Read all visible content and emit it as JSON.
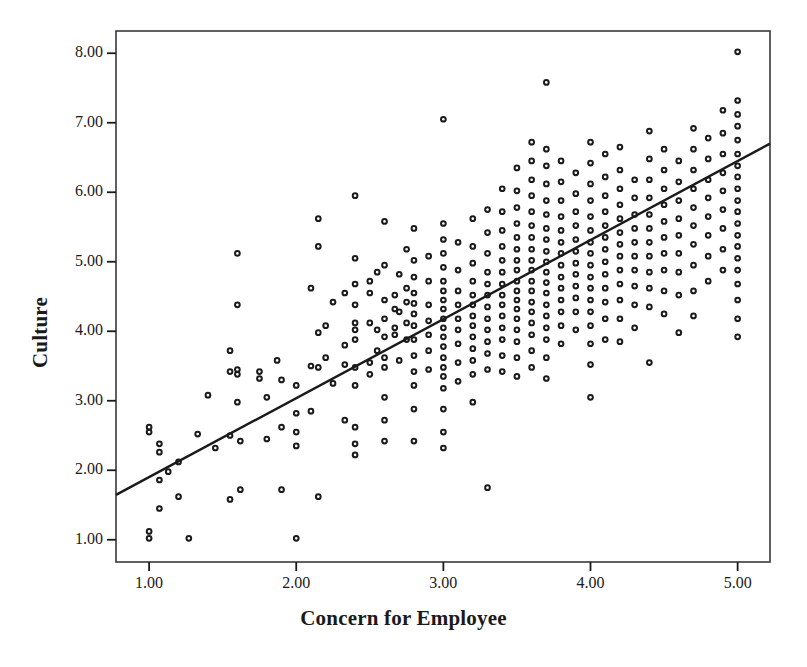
{
  "chart_data": {
    "type": "scatter",
    "title": "",
    "xlabel": "Concern for Employee",
    "ylabel": "Culture",
    "xlim": [
      0.775,
      5.22
    ],
    "ylim": [
      0.68,
      8.32
    ],
    "xticks": [
      "1.00",
      "2.00",
      "3.00",
      "4.00",
      "5.00"
    ],
    "xtick_values": [
      1,
      2,
      3,
      4,
      5
    ],
    "yticks": [
      "1.00",
      "2.00",
      "3.00",
      "4.00",
      "5.00",
      "6.00",
      "7.00",
      "8.00"
    ],
    "ytick_values": [
      1,
      2,
      3,
      4,
      5,
      6,
      7,
      8
    ],
    "grid": false,
    "legend": null,
    "marker": "open-circle",
    "marker_color": "#1a1a1a",
    "frame_color": "#3a3a3a",
    "background": "#ffffff",
    "fit_line": {
      "type": "linear-regression",
      "color": "#1a1a1a",
      "x_start": 0.775,
      "y_start": 1.645,
      "x_end": 5.22,
      "y_end": 6.7,
      "slope": 1.138,
      "intercept": 0.763
    },
    "points": [
      [
        1.0,
        2.62
      ],
      [
        1.0,
        2.55
      ],
      [
        1.0,
        1.12
      ],
      [
        1.0,
        1.02
      ],
      [
        1.07,
        2.38
      ],
      [
        1.07,
        2.26
      ],
      [
        1.07,
        1.86
      ],
      [
        1.07,
        1.45
      ],
      [
        1.13,
        1.98
      ],
      [
        1.2,
        2.12
      ],
      [
        1.2,
        1.62
      ],
      [
        1.27,
        1.02
      ],
      [
        1.33,
        2.52
      ],
      [
        1.4,
        3.08
      ],
      [
        1.45,
        2.32
      ],
      [
        1.55,
        3.72
      ],
      [
        1.55,
        3.42
      ],
      [
        1.55,
        2.5
      ],
      [
        1.55,
        1.58
      ],
      [
        1.6,
        5.12
      ],
      [
        1.6,
        4.38
      ],
      [
        1.6,
        3.45
      ],
      [
        1.6,
        3.38
      ],
      [
        1.6,
        2.98
      ],
      [
        1.62,
        2.42
      ],
      [
        1.62,
        1.72
      ],
      [
        1.75,
        3.42
      ],
      [
        1.75,
        3.32
      ],
      [
        1.8,
        3.05
      ],
      [
        1.8,
        2.45
      ],
      [
        1.87,
        3.58
      ],
      [
        1.9,
        3.3
      ],
      [
        1.9,
        2.62
      ],
      [
        1.9,
        1.72
      ],
      [
        2.0,
        3.22
      ],
      [
        2.0,
        2.82
      ],
      [
        2.0,
        2.55
      ],
      [
        2.0,
        2.35
      ],
      [
        2.0,
        1.02
      ],
      [
        2.1,
        4.62
      ],
      [
        2.1,
        3.5
      ],
      [
        2.1,
        2.85
      ],
      [
        2.15,
        5.62
      ],
      [
        2.15,
        5.22
      ],
      [
        2.15,
        3.98
      ],
      [
        2.15,
        3.48
      ],
      [
        2.15,
        1.62
      ],
      [
        2.2,
        4.08
      ],
      [
        2.2,
        3.62
      ],
      [
        2.25,
        4.42
      ],
      [
        2.25,
        3.25
      ],
      [
        2.33,
        4.55
      ],
      [
        2.33,
        3.8
      ],
      [
        2.33,
        3.52
      ],
      [
        2.33,
        2.72
      ],
      [
        2.4,
        5.95
      ],
      [
        2.4,
        5.05
      ],
      [
        2.4,
        4.68
      ],
      [
        2.4,
        4.38
      ],
      [
        2.4,
        4.12
      ],
      [
        2.4,
        4.02
      ],
      [
        2.4,
        3.88
      ],
      [
        2.4,
        3.48
      ],
      [
        2.4,
        3.22
      ],
      [
        2.4,
        2.62
      ],
      [
        2.4,
        2.38
      ],
      [
        2.4,
        2.22
      ],
      [
        2.5,
        4.72
      ],
      [
        2.5,
        4.55
      ],
      [
        2.5,
        4.12
      ],
      [
        2.5,
        3.55
      ],
      [
        2.5,
        3.38
      ],
      [
        2.55,
        4.85
      ],
      [
        2.55,
        4.02
      ],
      [
        2.55,
        3.72
      ],
      [
        2.6,
        5.58
      ],
      [
        2.6,
        4.95
      ],
      [
        2.6,
        4.45
      ],
      [
        2.6,
        4.18
      ],
      [
        2.6,
        3.92
      ],
      [
        2.6,
        3.62
      ],
      [
        2.6,
        3.48
      ],
      [
        2.6,
        3.05
      ],
      [
        2.6,
        2.72
      ],
      [
        2.6,
        2.42
      ],
      [
        2.67,
        4.52
      ],
      [
        2.67,
        4.32
      ],
      [
        2.67,
        4.05
      ],
      [
        2.67,
        3.95
      ],
      [
        2.7,
        4.82
      ],
      [
        2.7,
        4.28
      ],
      [
        2.7,
        3.58
      ],
      [
        2.75,
        5.18
      ],
      [
        2.75,
        4.62
      ],
      [
        2.75,
        4.42
      ],
      [
        2.75,
        4.12
      ],
      [
        2.75,
        3.88
      ],
      [
        2.8,
        5.48
      ],
      [
        2.8,
        5.02
      ],
      [
        2.8,
        4.78
      ],
      [
        2.8,
        4.55
      ],
      [
        2.8,
        4.4
      ],
      [
        2.8,
        4.25
      ],
      [
        2.8,
        4.08
      ],
      [
        2.8,
        3.88
      ],
      [
        2.8,
        3.65
      ],
      [
        2.8,
        3.42
      ],
      [
        2.8,
        3.22
      ],
      [
        2.8,
        2.88
      ],
      [
        2.8,
        2.42
      ],
      [
        2.9,
        5.08
      ],
      [
        2.9,
        4.72
      ],
      [
        2.9,
        4.38
      ],
      [
        2.9,
        4.15
      ],
      [
        2.9,
        3.95
      ],
      [
        2.9,
        3.72
      ],
      [
        2.9,
        3.45
      ],
      [
        3.0,
        7.05
      ],
      [
        3.0,
        5.55
      ],
      [
        3.0,
        5.32
      ],
      [
        3.0,
        5.12
      ],
      [
        3.0,
        4.92
      ],
      [
        3.0,
        4.72
      ],
      [
        3.0,
        4.58
      ],
      [
        3.0,
        4.45
      ],
      [
        3.0,
        4.32
      ],
      [
        3.0,
        4.18
      ],
      [
        3.0,
        4.05
      ],
      [
        3.0,
        3.92
      ],
      [
        3.0,
        3.78
      ],
      [
        3.0,
        3.62
      ],
      [
        3.0,
        3.48
      ],
      [
        3.0,
        3.35
      ],
      [
        3.0,
        3.18
      ],
      [
        3.0,
        2.88
      ],
      [
        3.0,
        2.55
      ],
      [
        3.0,
        2.32
      ],
      [
        3.1,
        5.28
      ],
      [
        3.1,
        4.88
      ],
      [
        3.1,
        4.58
      ],
      [
        3.1,
        4.38
      ],
      [
        3.1,
        4.18
      ],
      [
        3.1,
        4.02
      ],
      [
        3.1,
        3.82
      ],
      [
        3.1,
        3.55
      ],
      [
        3.1,
        3.28
      ],
      [
        3.2,
        5.62
      ],
      [
        3.2,
        5.22
      ],
      [
        3.2,
        4.98
      ],
      [
        3.2,
        4.72
      ],
      [
        3.2,
        4.52
      ],
      [
        3.2,
        4.38
      ],
      [
        3.2,
        4.22
      ],
      [
        3.2,
        4.08
      ],
      [
        3.2,
        3.92
      ],
      [
        3.2,
        3.75
      ],
      [
        3.2,
        3.58
      ],
      [
        3.2,
        3.38
      ],
      [
        3.2,
        2.98
      ],
      [
        3.3,
        5.75
      ],
      [
        3.3,
        5.42
      ],
      [
        3.3,
        5.12
      ],
      [
        3.3,
        4.85
      ],
      [
        3.3,
        4.68
      ],
      [
        3.3,
        4.52
      ],
      [
        3.3,
        4.35
      ],
      [
        3.3,
        4.18
      ],
      [
        3.3,
        4.02
      ],
      [
        3.3,
        3.85
      ],
      [
        3.3,
        3.68
      ],
      [
        3.3,
        3.45
      ],
      [
        3.3,
        1.75
      ],
      [
        3.4,
        6.05
      ],
      [
        3.4,
        5.72
      ],
      [
        3.4,
        5.45
      ],
      [
        3.4,
        5.22
      ],
      [
        3.4,
        5.02
      ],
      [
        3.4,
        4.85
      ],
      [
        3.4,
        4.68
      ],
      [
        3.4,
        4.52
      ],
      [
        3.4,
        4.38
      ],
      [
        3.4,
        4.22
      ],
      [
        3.4,
        4.05
      ],
      [
        3.4,
        3.88
      ],
      [
        3.4,
        3.65
      ],
      [
        3.4,
        3.42
      ],
      [
        3.5,
        6.35
      ],
      [
        3.5,
        6.02
      ],
      [
        3.5,
        5.78
      ],
      [
        3.5,
        5.55
      ],
      [
        3.5,
        5.35
      ],
      [
        3.5,
        5.18
      ],
      [
        3.5,
        5.02
      ],
      [
        3.5,
        4.88
      ],
      [
        3.5,
        4.72
      ],
      [
        3.5,
        4.58
      ],
      [
        3.5,
        4.45
      ],
      [
        3.5,
        4.32
      ],
      [
        3.5,
        4.18
      ],
      [
        3.5,
        4.02
      ],
      [
        3.5,
        3.85
      ],
      [
        3.5,
        3.62
      ],
      [
        3.5,
        3.35
      ],
      [
        3.6,
        6.72
      ],
      [
        3.6,
        6.45
      ],
      [
        3.6,
        6.18
      ],
      [
        3.6,
        5.95
      ],
      [
        3.6,
        5.72
      ],
      [
        3.6,
        5.52
      ],
      [
        3.6,
        5.35
      ],
      [
        3.6,
        5.18
      ],
      [
        3.6,
        5.02
      ],
      [
        3.6,
        4.88
      ],
      [
        3.6,
        4.72
      ],
      [
        3.6,
        4.58
      ],
      [
        3.6,
        4.42
      ],
      [
        3.6,
        4.28
      ],
      [
        3.6,
        4.12
      ],
      [
        3.6,
        3.95
      ],
      [
        3.6,
        3.72
      ],
      [
        3.6,
        3.48
      ],
      [
        3.7,
        7.58
      ],
      [
        3.7,
        6.62
      ],
      [
        3.7,
        6.38
      ],
      [
        3.7,
        6.12
      ],
      [
        3.7,
        5.88
      ],
      [
        3.7,
        5.68
      ],
      [
        3.7,
        5.48
      ],
      [
        3.7,
        5.32
      ],
      [
        3.7,
        5.15
      ],
      [
        3.7,
        5.0
      ],
      [
        3.7,
        4.85
      ],
      [
        3.7,
        4.7
      ],
      [
        3.7,
        4.55
      ],
      [
        3.7,
        4.38
      ],
      [
        3.7,
        4.22
      ],
      [
        3.7,
        4.05
      ],
      [
        3.7,
        3.88
      ],
      [
        3.7,
        3.62
      ],
      [
        3.7,
        3.32
      ],
      [
        3.8,
        6.45
      ],
      [
        3.8,
        6.15
      ],
      [
        3.8,
        5.88
      ],
      [
        3.8,
        5.65
      ],
      [
        3.8,
        5.45
      ],
      [
        3.8,
        5.28
      ],
      [
        3.8,
        5.12
      ],
      [
        3.8,
        4.95
      ],
      [
        3.8,
        4.78
      ],
      [
        3.8,
        4.62
      ],
      [
        3.8,
        4.45
      ],
      [
        3.8,
        4.28
      ],
      [
        3.8,
        4.08
      ],
      [
        3.8,
        3.82
      ],
      [
        3.9,
        6.28
      ],
      [
        3.9,
        5.98
      ],
      [
        3.9,
        5.72
      ],
      [
        3.9,
        5.52
      ],
      [
        3.9,
        5.32
      ],
      [
        3.9,
        5.15
      ],
      [
        3.9,
        4.98
      ],
      [
        3.9,
        4.82
      ],
      [
        3.9,
        4.65
      ],
      [
        3.9,
        4.48
      ],
      [
        3.9,
        4.28
      ],
      [
        3.9,
        4.02
      ],
      [
        4.0,
        6.72
      ],
      [
        4.0,
        6.42
      ],
      [
        4.0,
        6.12
      ],
      [
        4.0,
        5.88
      ],
      [
        4.0,
        5.65
      ],
      [
        4.0,
        5.45
      ],
      [
        4.0,
        5.28
      ],
      [
        4.0,
        5.12
      ],
      [
        4.0,
        4.95
      ],
      [
        4.0,
        4.78
      ],
      [
        4.0,
        4.62
      ],
      [
        4.0,
        4.45
      ],
      [
        4.0,
        4.28
      ],
      [
        4.0,
        4.08
      ],
      [
        4.0,
        3.82
      ],
      [
        4.0,
        3.52
      ],
      [
        4.0,
        3.05
      ],
      [
        4.1,
        6.55
      ],
      [
        4.1,
        6.22
      ],
      [
        4.1,
        5.95
      ],
      [
        4.1,
        5.72
      ],
      [
        4.1,
        5.52
      ],
      [
        4.1,
        5.35
      ],
      [
        4.1,
        5.18
      ],
      [
        4.1,
        5.0
      ],
      [
        4.1,
        4.82
      ],
      [
        4.1,
        4.62
      ],
      [
        4.1,
        4.42
      ],
      [
        4.1,
        4.18
      ],
      [
        4.1,
        3.88
      ],
      [
        4.2,
        6.65
      ],
      [
        4.2,
        6.32
      ],
      [
        4.2,
        6.05
      ],
      [
        4.2,
        5.82
      ],
      [
        4.2,
        5.62
      ],
      [
        4.2,
        5.42
      ],
      [
        4.2,
        5.25
      ],
      [
        4.2,
        5.08
      ],
      [
        4.2,
        4.88
      ],
      [
        4.2,
        4.68
      ],
      [
        4.2,
        4.45
      ],
      [
        4.2,
        4.18
      ],
      [
        4.2,
        3.85
      ],
      [
        4.3,
        6.18
      ],
      [
        4.3,
        5.92
      ],
      [
        4.3,
        5.68
      ],
      [
        4.3,
        5.48
      ],
      [
        4.3,
        5.28
      ],
      [
        4.3,
        5.08
      ],
      [
        4.3,
        4.88
      ],
      [
        4.3,
        4.65
      ],
      [
        4.3,
        4.38
      ],
      [
        4.3,
        4.05
      ],
      [
        4.4,
        6.88
      ],
      [
        4.4,
        6.48
      ],
      [
        4.4,
        6.18
      ],
      [
        4.4,
        5.92
      ],
      [
        4.4,
        5.68
      ],
      [
        4.4,
        5.48
      ],
      [
        4.4,
        5.28
      ],
      [
        4.4,
        5.08
      ],
      [
        4.4,
        4.85
      ],
      [
        4.4,
        4.62
      ],
      [
        4.4,
        4.35
      ],
      [
        4.4,
        3.55
      ],
      [
        4.5,
        6.62
      ],
      [
        4.5,
        6.32
      ],
      [
        4.5,
        6.05
      ],
      [
        4.5,
        5.82
      ],
      [
        4.5,
        5.58
      ],
      [
        4.5,
        5.35
      ],
      [
        4.5,
        5.12
      ],
      [
        4.5,
        4.88
      ],
      [
        4.5,
        4.58
      ],
      [
        4.5,
        4.25
      ],
      [
        4.6,
        6.45
      ],
      [
        4.6,
        6.15
      ],
      [
        4.6,
        5.88
      ],
      [
        4.6,
        5.62
      ],
      [
        4.6,
        5.38
      ],
      [
        4.6,
        5.12
      ],
      [
        4.6,
        4.85
      ],
      [
        4.6,
        4.52
      ],
      [
        4.6,
        3.98
      ],
      [
        4.7,
        6.92
      ],
      [
        4.7,
        6.62
      ],
      [
        4.7,
        6.32
      ],
      [
        4.7,
        6.05
      ],
      [
        4.7,
        5.78
      ],
      [
        4.7,
        5.52
      ],
      [
        4.7,
        5.25
      ],
      [
        4.7,
        4.95
      ],
      [
        4.7,
        4.58
      ],
      [
        4.7,
        4.22
      ],
      [
        4.8,
        6.78
      ],
      [
        4.8,
        6.48
      ],
      [
        4.8,
        6.18
      ],
      [
        4.8,
        5.92
      ],
      [
        4.8,
        5.65
      ],
      [
        4.8,
        5.38
      ],
      [
        4.8,
        5.08
      ],
      [
        4.8,
        4.72
      ],
      [
        4.9,
        7.18
      ],
      [
        4.9,
        6.85
      ],
      [
        4.9,
        6.55
      ],
      [
        4.9,
        6.28
      ],
      [
        4.9,
        6.02
      ],
      [
        4.9,
        5.75
      ],
      [
        4.9,
        5.48
      ],
      [
        4.9,
        5.18
      ],
      [
        4.9,
        4.88
      ],
      [
        5.0,
        8.02
      ],
      [
        5.0,
        7.32
      ],
      [
        5.0,
        7.12
      ],
      [
        5.0,
        6.95
      ],
      [
        5.0,
        6.75
      ],
      [
        5.0,
        6.55
      ],
      [
        5.0,
        6.38
      ],
      [
        5.0,
        6.22
      ],
      [
        5.0,
        6.05
      ],
      [
        5.0,
        5.88
      ],
      [
        5.0,
        5.72
      ],
      [
        5.0,
        5.55
      ],
      [
        5.0,
        5.38
      ],
      [
        5.0,
        5.22
      ],
      [
        5.0,
        5.05
      ],
      [
        5.0,
        4.88
      ],
      [
        5.0,
        4.68
      ],
      [
        5.0,
        4.45
      ],
      [
        5.0,
        4.18
      ],
      [
        5.0,
        3.92
      ]
    ]
  }
}
